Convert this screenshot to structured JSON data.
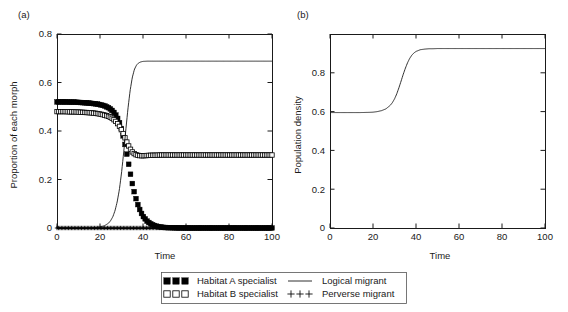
{
  "figure": {
    "panel_a_label": "(a)",
    "panel_b_label": "(b)"
  },
  "legend": {
    "entries": [
      {
        "marker": "filled-square",
        "label": "Habitat A specialist"
      },
      {
        "marker": "line",
        "label": "Logical migrant"
      },
      {
        "marker": "open-square",
        "label": "Habitat B specialist"
      },
      {
        "marker": "plus",
        "label": "Perverse migrant"
      }
    ]
  },
  "chart_data": [
    {
      "id": "panel-a",
      "type": "line",
      "title": "(a)",
      "xlabel": "Time",
      "ylabel": "Proportion of each morph",
      "xlim": [
        0,
        100
      ],
      "ylim": [
        0,
        0.8
      ],
      "xticks": [
        0,
        20,
        40,
        60,
        80,
        100
      ],
      "yticks": [
        0,
        0.2,
        0.4,
        0.6,
        0.8
      ],
      "xticklabels": [
        "0",
        "20",
        "40",
        "60",
        "80",
        "100"
      ],
      "yticklabels": [
        "0",
        "0.2",
        "0.4",
        "0.6",
        "0.8"
      ],
      "grid": false,
      "legend_position": "below-figure",
      "x": [
        0,
        2,
        4,
        6,
        8,
        10,
        12,
        14,
        16,
        18,
        20,
        22,
        24,
        25,
        26,
        27,
        28,
        29,
        30,
        31,
        32,
        33,
        34,
        35,
        36,
        37,
        38,
        39,
        40,
        42,
        44,
        46,
        48,
        50,
        55,
        60,
        70,
        80,
        90,
        100
      ],
      "series": [
        {
          "name": "Habitat A specialist",
          "marker": "filled-square",
          "values": [
            0.52,
            0.52,
            0.52,
            0.519,
            0.519,
            0.518,
            0.517,
            0.516,
            0.514,
            0.512,
            0.509,
            0.504,
            0.496,
            0.49,
            0.482,
            0.471,
            0.456,
            0.436,
            0.408,
            0.372,
            0.328,
            0.279,
            0.23,
            0.185,
            0.146,
            0.113,
            0.086,
            0.065,
            0.049,
            0.027,
            0.015,
            0.008,
            0.004,
            0.002,
            0.001,
            0.0,
            0.0,
            0.0,
            0.0,
            0.0
          ]
        },
        {
          "name": "Habitat B specialist",
          "marker": "open-square",
          "values": [
            0.48,
            0.48,
            0.48,
            0.479,
            0.479,
            0.478,
            0.477,
            0.476,
            0.475,
            0.473,
            0.47,
            0.466,
            0.46,
            0.456,
            0.45,
            0.443,
            0.433,
            0.42,
            0.404,
            0.385,
            0.364,
            0.344,
            0.327,
            0.314,
            0.306,
            0.301,
            0.299,
            0.298,
            0.298,
            0.299,
            0.3,
            0.3,
            0.301,
            0.301,
            0.301,
            0.301,
            0.301,
            0.301,
            0.301,
            0.301
          ]
        },
        {
          "name": "Logical migrant",
          "marker": "line",
          "values": [
            0.0,
            0.0,
            0.0,
            0.0,
            0.0,
            0.0,
            0.0,
            0.0,
            0.001,
            0.002,
            0.004,
            0.009,
            0.02,
            0.031,
            0.047,
            0.072,
            0.108,
            0.158,
            0.226,
            0.31,
            0.404,
            0.492,
            0.566,
            0.62,
            0.654,
            0.672,
            0.681,
            0.685,
            0.687,
            0.688,
            0.688,
            0.688,
            0.688,
            0.688,
            0.688,
            0.688,
            0.688,
            0.688,
            0.688,
            0.688
          ]
        },
        {
          "name": "Perverse migrant",
          "marker": "plus",
          "values": [
            0.0,
            0.0,
            0.0,
            0.0,
            0.0,
            0.0,
            0.0,
            0.0,
            0.0,
            0.0,
            0.0,
            0.0,
            0.0,
            0.0,
            0.0,
            0.0,
            0.0,
            0.0,
            0.0,
            0.0,
            0.0,
            0.0,
            0.0,
            0.0,
            0.0,
            0.0,
            0.0,
            0.0,
            0.0,
            0.0,
            0.0,
            0.0,
            0.0,
            0.0,
            0.0,
            0.0,
            0.0,
            0.0,
            0.0,
            0.0
          ]
        }
      ]
    },
    {
      "id": "panel-b",
      "type": "line",
      "title": "(b)",
      "xlabel": "Time",
      "ylabel": "Population density",
      "xlim": [
        0,
        100
      ],
      "ylim": [
        0,
        1.0
      ],
      "xticks": [
        0,
        20,
        40,
        60,
        80,
        100
      ],
      "yticks": [
        0,
        0.2,
        0.4,
        0.6,
        0.8
      ],
      "xticklabels": [
        "0",
        "20",
        "40",
        "60",
        "80",
        "100"
      ],
      "yticklabels": [
        "0",
        "0.2",
        "0.4",
        "0.6",
        "0.8"
      ],
      "grid": false,
      "legend_position": "none",
      "x": [
        0,
        5,
        10,
        14,
        18,
        20,
        22,
        24,
        26,
        28,
        29,
        30,
        31,
        32,
        33,
        34,
        35,
        36,
        37,
        38,
        39,
        40,
        42,
        44,
        46,
        48,
        50,
        55,
        60,
        70,
        80,
        90,
        100
      ],
      "series": [
        {
          "name": "Population density",
          "marker": "line",
          "values": [
            0.595,
            0.595,
            0.595,
            0.595,
            0.596,
            0.597,
            0.6,
            0.605,
            0.614,
            0.632,
            0.646,
            0.665,
            0.69,
            0.721,
            0.755,
            0.79,
            0.822,
            0.85,
            0.873,
            0.89,
            0.902,
            0.91,
            0.919,
            0.922,
            0.924,
            0.924,
            0.925,
            0.925,
            0.925,
            0.925,
            0.925,
            0.925,
            0.925
          ]
        }
      ]
    }
  ]
}
